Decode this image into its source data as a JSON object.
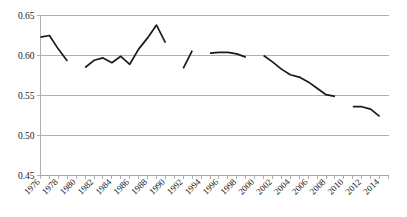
{
  "chart_data": {
    "type": "line",
    "title": "",
    "subtitle": "",
    "xlabel": "",
    "ylabel": "",
    "grid": true,
    "legend": false,
    "legend_position": "none",
    "line_color": "#1a1a1a",
    "grid_color": "#a6a6a6",
    "axis_color": "#808080",
    "background_color": "#ffffff",
    "ylim": [
      0.45,
      0.65
    ],
    "ytick_labels": [
      "0.65",
      "0.60",
      "0.55",
      "0.50",
      "0.45"
    ],
    "ytick_values": [
      0.65,
      0.6,
      0.55,
      0.5,
      0.45
    ],
    "xlim": [
      1976,
      2015
    ],
    "xtick_labels": [
      "1976",
      "1978",
      "1980",
      "1982",
      "1984",
      "1986",
      "1988",
      "1990",
      "1992",
      "1994",
      "1996",
      "1998",
      "2000",
      "2002",
      "2004",
      "2006",
      "2008",
      "2010",
      "2012",
      "2014"
    ],
    "xtick_values": [
      1976,
      1978,
      1980,
      1982,
      1984,
      1986,
      1988,
      1990,
      1992,
      1994,
      1996,
      1998,
      2000,
      2002,
      2004,
      2006,
      2008,
      2010,
      2012,
      2014
    ],
    "xtick_label_rotation_deg": -45,
    "minor_tick_interval_years": 1,
    "series": [
      {
        "name": "series-1",
        "note": "line is drawn in disjoint segments with gaps where data is missing",
        "segments": [
          {
            "name": "segment-1976-1979",
            "x": [
              1976,
              1977,
              1978,
              1979
            ],
            "y": [
              0.623,
              0.625,
              0.608,
              0.593
            ]
          },
          {
            "name": "segment-1981-1990",
            "x": [
              1981,
              1982,
              1983,
              1984,
              1985,
              1986,
              1987,
              1988,
              1989,
              1990
            ],
            "y": [
              0.585,
              0.594,
              0.597,
              0.591,
              0.599,
              0.589,
              0.608,
              0.622,
              0.638,
              0.616
            ]
          },
          {
            "name": "segment-1992-1993",
            "x": [
              1992,
              1993
            ],
            "y": [
              0.584,
              0.606
            ]
          },
          {
            "name": "segment-1995-1999",
            "x": [
              1995,
              1996,
              1997,
              1998,
              1999
            ],
            "y": [
              0.603,
              0.604,
              0.604,
              0.602,
              0.598
            ]
          },
          {
            "name": "segment-2001-2009",
            "x": [
              2001,
              2002,
              2003,
              2004,
              2005,
              2006,
              2007,
              2008,
              2009
            ],
            "y": [
              0.6,
              0.592,
              0.583,
              0.576,
              0.573,
              0.567,
              0.559,
              0.551,
              0.549
            ]
          },
          {
            "name": "segment-2011-2014",
            "x": [
              2011,
              2012,
              2013,
              2014
            ],
            "y": [
              0.536,
              0.536,
              0.533,
              0.524
            ]
          }
        ]
      }
    ]
  }
}
